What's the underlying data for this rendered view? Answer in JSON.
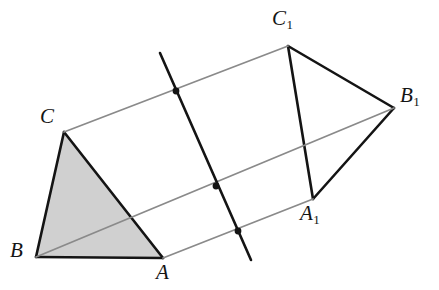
{
  "figure": {
    "width": 439,
    "height": 290,
    "background_color": "#ffffff"
  },
  "colors": {
    "edge_black": "#141414",
    "edge_gray": "#8a8a8a",
    "shaded_face_fill": "#d0d0d0",
    "dot_fill": "#141414",
    "label_color": "#141414"
  },
  "chart_data": {
    "type": "diagram",
    "vertices": [
      {
        "name": "A",
        "label": "A",
        "sub": "",
        "x": 163,
        "y": 258,
        "label_x": 156,
        "label_y": 262
      },
      {
        "name": "B",
        "label": "B",
        "sub": "",
        "x": 36,
        "y": 257,
        "label_x": 10,
        "label_y": 240
      },
      {
        "name": "C",
        "label": "C",
        "sub": "",
        "x": 64,
        "y": 132,
        "label_x": 40,
        "label_y": 106
      },
      {
        "name": "A1",
        "label": "A",
        "sub": "1",
        "x": 313,
        "y": 199,
        "label_x": 300,
        "label_y": 203
      },
      {
        "name": "B1",
        "label": "B",
        "sub": "1",
        "x": 394,
        "y": 108,
        "label_x": 400,
        "label_y": 85
      },
      {
        "name": "C1",
        "label": "C",
        "sub": "1",
        "x": 288,
        "y": 46,
        "label_x": 272,
        "label_y": 8
      }
    ],
    "faces": [
      {
        "name": "front-triangle-ABC",
        "points": "163,258 36,257 64,132",
        "fill": "#d0d0d0",
        "shaded": true
      }
    ],
    "edges": [
      {
        "name": "edge-A-B",
        "from": "A",
        "to": "B",
        "color": "#141414",
        "width": 2.6
      },
      {
        "name": "edge-B-C",
        "from": "B",
        "to": "C",
        "color": "#141414",
        "width": 2.6
      },
      {
        "name": "edge-C-A",
        "from": "C",
        "to": "A",
        "color": "#141414",
        "width": 2.6
      },
      {
        "name": "edge-A1-B1",
        "from": "A1",
        "to": "B1",
        "color": "#141414",
        "width": 2.6
      },
      {
        "name": "edge-B1-C1",
        "from": "B1",
        "to": "C1",
        "color": "#141414",
        "width": 2.6
      },
      {
        "name": "edge-C1-A1",
        "from": "C1",
        "to": "A1",
        "color": "#141414",
        "width": 2.6
      },
      {
        "name": "lateral-edge-A-A1",
        "from": "A",
        "to": "A1",
        "color": "#8a8a8a",
        "width": 1.8
      },
      {
        "name": "lateral-edge-B-B1",
        "from": "B",
        "to": "B1",
        "color": "#8a8a8a",
        "width": 1.8
      },
      {
        "name": "lateral-edge-C-C1",
        "from": "C",
        "to": "C1",
        "color": "#8a8a8a",
        "width": 1.8
      }
    ],
    "cutting_line": {
      "name": "cutting-line",
      "x1": 160,
      "y1": 53,
      "x2": 251,
      "y2": 260,
      "color": "#141414",
      "width": 2.6
    },
    "intersection_points": [
      {
        "name": "intersection-on-CC1",
        "x": 176,
        "y": 91,
        "r": 3.4
      },
      {
        "name": "intersection-on-BB1",
        "x": 216,
        "y": 186,
        "r": 3.4
      },
      {
        "name": "intersection-on-AA1",
        "x": 238,
        "y": 231,
        "r": 3.4
      }
    ]
  }
}
